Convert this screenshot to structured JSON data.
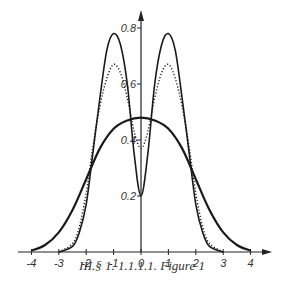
{
  "caption": "III.§ 1. 1.1.1.1. Figure 1",
  "chart_data": {
    "type": "line",
    "title": "",
    "xlabel": "",
    "ylabel": "",
    "xlim": [
      -4,
      4
    ],
    "ylim": [
      0,
      0.8
    ],
    "x_ticks": [
      -4,
      -3,
      -2,
      -1,
      0,
      1,
      2,
      3,
      4
    ],
    "x_tick_labels": [
      "-4",
      "-3",
      "-2",
      "-1",
      "0",
      "1",
      "2",
      "3",
      "4"
    ],
    "y_ticks": [
      0.2,
      0.4,
      0.6,
      0.8
    ],
    "y_tick_labels": [
      "0.2",
      "0.4",
      "0.6",
      "0.8"
    ],
    "grid": false,
    "legend": null,
    "series": [
      {
        "name": "wide curve (bold solid)",
        "style": "solid-bold",
        "x": [
          -4,
          -3.5,
          -3,
          -2.5,
          -2,
          -1.5,
          -1,
          -0.5,
          0,
          0.5,
          1,
          1.5,
          2,
          2.5,
          3,
          3.5,
          4
        ],
        "values": [
          0.005,
          0.025,
          0.07,
          0.15,
          0.26,
          0.37,
          0.44,
          0.47,
          0.48,
          0.47,
          0.44,
          0.37,
          0.26,
          0.15,
          0.07,
          0.025,
          0.005
        ]
      },
      {
        "name": "double-peaked curve (solid)",
        "style": "solid",
        "x": [
          -3,
          -2.5,
          -2.25,
          -2,
          -1.75,
          -1.5,
          -1.25,
          -1,
          -0.75,
          -0.5,
          -0.25,
          0,
          0.25,
          0.5,
          0.75,
          1,
          1.25,
          1.5,
          1.75,
          2,
          2.25,
          2.5,
          3
        ],
        "values": [
          0,
          0.02,
          0.07,
          0.17,
          0.36,
          0.55,
          0.72,
          0.78,
          0.74,
          0.6,
          0.35,
          0.2,
          0.35,
          0.6,
          0.74,
          0.78,
          0.72,
          0.55,
          0.36,
          0.17,
          0.07,
          0.02,
          0
        ]
      },
      {
        "name": "double-peaked curve (dotted)",
        "style": "dotted",
        "x": [
          -3,
          -2.5,
          -2.25,
          -2,
          -1.75,
          -1.5,
          -1.25,
          -1,
          -0.75,
          -0.5,
          -0.25,
          0,
          0.25,
          0.5,
          0.75,
          1,
          1.25,
          1.5,
          1.75,
          2,
          2.25,
          2.5,
          3
        ],
        "values": [
          0,
          0.03,
          0.09,
          0.21,
          0.38,
          0.52,
          0.62,
          0.67,
          0.64,
          0.55,
          0.43,
          0.37,
          0.43,
          0.55,
          0.64,
          0.67,
          0.62,
          0.52,
          0.38,
          0.21,
          0.09,
          0.03,
          0
        ]
      }
    ]
  }
}
